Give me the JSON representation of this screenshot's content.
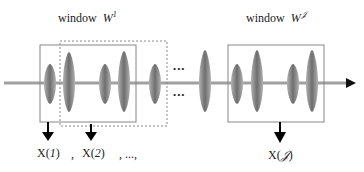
{
  "window_labels": {
    "first": {
      "prefix": "window",
      "symbol": "W",
      "superscript": "1"
    },
    "last": {
      "prefix": "window",
      "symbol": "W",
      "superscript": "𝒥"
    }
  },
  "outputs": {
    "x1": {
      "base": "X(",
      "index": "1",
      "close": ")"
    },
    "sep1": ",",
    "x2": {
      "base": "X(",
      "index": "2",
      "close": ")"
    },
    "sep2": ", ...,",
    "xJ": {
      "base": "X(",
      "index": "𝒥",
      "close": ")"
    }
  },
  "ellipsis": "•••",
  "colors": {
    "waveform": "#8a8a8a",
    "axis": "#9a9a9a",
    "box": "#888888",
    "arrow": "#000000"
  }
}
